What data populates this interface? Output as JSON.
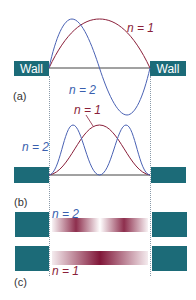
{
  "colors": {
    "wall": "#1c6b78",
    "n1_curve": "#8a1f3a",
    "n2_curve": "#4a62b4",
    "baseline": "#444444",
    "band": "#7a0a2e"
  },
  "panel_a": {
    "label": "(a)",
    "wall_left": "Wall",
    "wall_right": "Wall",
    "n1_label": "n = 1",
    "n2_label": "n = 2"
  },
  "panel_b": {
    "label": "(b)",
    "n1_label": "n = 1",
    "n2_label": "n = 2"
  },
  "panel_c": {
    "label": "(c)",
    "n2_label": "n = 2",
    "n1_label": "n = 1"
  }
}
